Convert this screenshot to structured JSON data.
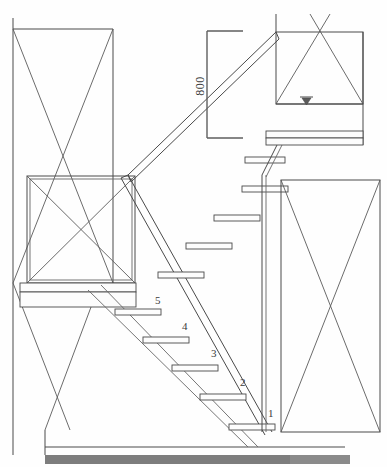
{
  "drawing": {
    "title": "Staircase Elevation Detail",
    "background_color": "#fefefe",
    "line_color": "#4a4a4a",
    "dimensions": [
      {
        "name": "vertical-height",
        "value": "800",
        "orientation": "vertical",
        "x": 207,
        "y_top": 31,
        "y_bottom": 138
      }
    ],
    "step_labels": [
      {
        "number": "1",
        "x": 268,
        "y": 417
      },
      {
        "number": "2",
        "x": 240,
        "y": 386
      },
      {
        "number": "3",
        "x": 211,
        "y": 357
      },
      {
        "number": "4",
        "x": 182,
        "y": 330
      },
      {
        "number": "5",
        "x": 155,
        "y": 304
      }
    ],
    "level_marker": {
      "name": "elevation-triangle",
      "symbol": "▽",
      "x": 306,
      "y": 103
    },
    "panels": [
      {
        "name": "left-upper-panel",
        "x": 13,
        "y": 29,
        "w": 100,
        "h": 253,
        "bracing": "x"
      },
      {
        "name": "left-lower-panel",
        "x": 27,
        "y": 176,
        "w": 108,
        "h": 107,
        "bracing": "x"
      },
      {
        "name": "right-upper-panel",
        "x": 276,
        "y": 32,
        "w": 87,
        "h": 72,
        "bracing": "x"
      },
      {
        "name": "right-lower-panel",
        "x": 281,
        "y": 180,
        "w": 99,
        "h": 252,
        "bracing": "x"
      }
    ],
    "floor_bar": {
      "name": "ground-hatch-bar",
      "x": 45,
      "y": 455,
      "width": 305,
      "height": 9,
      "color": "#8a8a8a"
    }
  }
}
